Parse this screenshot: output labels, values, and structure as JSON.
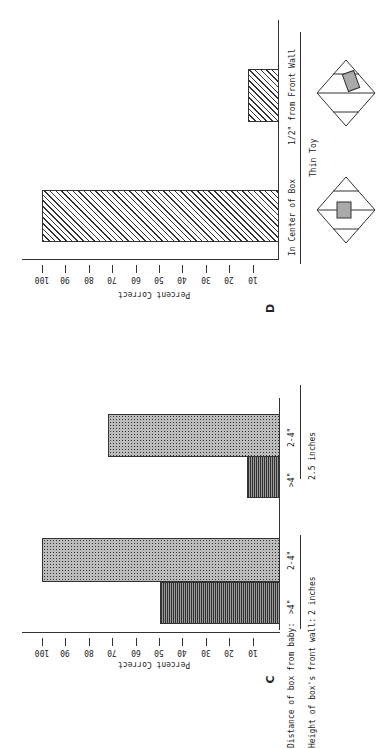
{
  "chart_data": [
    {
      "panel": "C",
      "type": "bar",
      "orientation": "rotated 90° on page (horizontal bars in image)",
      "ylabel": "Percent Correct",
      "ylim": [
        0,
        100
      ],
      "yticks": [
        10,
        20,
        30,
        40,
        50,
        60,
        70,
        80,
        90,
        100
      ],
      "group_axis_labels": [
        "Distance of box from baby:",
        "Height of box's front wall:"
      ],
      "groups": [
        {
          "height": "2 inches",
          "bars": [
            {
              "distance": ">4\"",
              "value": 50,
              "pattern": "horizontal-lines"
            },
            {
              "distance": "2-4\"",
              "value": 100,
              "pattern": "dots"
            }
          ]
        },
        {
          "height": "2.5 inches",
          "bars": [
            {
              "distance": ">4\"",
              "value": 12,
              "pattern": "horizontal-lines"
            },
            {
              "distance": "2-4\"",
              "value": 72,
              "pattern": "dots"
            }
          ]
        }
      ]
    },
    {
      "panel": "D",
      "type": "bar",
      "ylabel": "Percent Correct",
      "ylim": [
        0,
        100
      ],
      "yticks": [
        10,
        20,
        30,
        40,
        50,
        60,
        70,
        80,
        90,
        100
      ],
      "xlabel": "Thin Toy",
      "categories": [
        "In Center of Box",
        "1/2\" from Front Wall"
      ],
      "values": [
        100,
        12
      ],
      "pattern": "diagonal-hatch"
    }
  ],
  "panelC": {
    "letter": "C",
    "ylabel": "Percent Correct",
    "ticks": [
      "100",
      "90",
      "80",
      "70",
      "60",
      "50",
      "40",
      "30",
      "20",
      "10"
    ],
    "row1_label": "Distance of box from baby:",
    "row2_label": "Height of box's front wall:",
    "bars": [
      {
        "dist": ">4\"",
        "value": 50
      },
      {
        "dist": "2-4\"",
        "value": 100
      },
      {
        "dist": ">4\"",
        "value": 12
      },
      {
        "dist": "2-4\"",
        "value": 72
      }
    ],
    "heights": [
      "2 inches",
      "2.5 inches"
    ]
  },
  "panelD": {
    "letter": "D",
    "ylabel": "Percent Correct",
    "ticks": [
      "100",
      "90",
      "80",
      "70",
      "60",
      "50",
      "40",
      "30",
      "20",
      "10"
    ],
    "cat1": "In Center of Box",
    "cat2": "1/2\" from Front Wall",
    "xlabel": "Thin Toy",
    "values": [
      100,
      12
    ]
  }
}
